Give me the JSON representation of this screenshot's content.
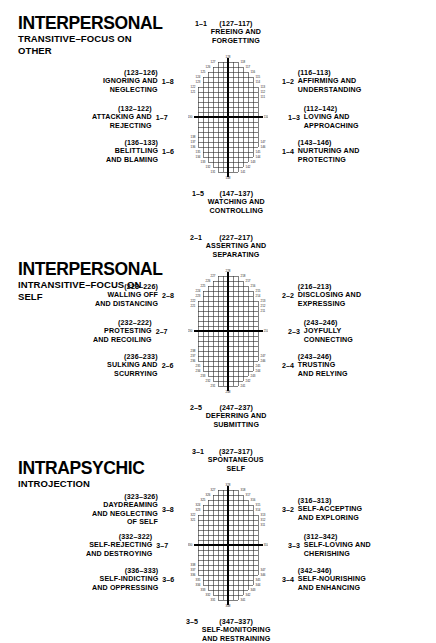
{
  "figure": {
    "line_color": "#000000",
    "background": "#ffffff"
  },
  "panels": [
    {
      "id": "interpersonal-transitive",
      "heading_main": "INTERPERSONAL",
      "heading_sub_line1": "TRANSITIVE–FOCUS ON",
      "heading_sub_line2": "OTHER",
      "poles": [
        {
          "qnum": "1–1",
          "code": "(127–117)",
          "lines": [
            "FREEING AND",
            "FORGETTING"
          ],
          "pos": "top"
        },
        {
          "qnum": "1–2",
          "code": "(116–113)",
          "lines": [
            "AFFIRMING AND",
            "UNDERSTANDING"
          ],
          "pos": "top-right"
        },
        {
          "qnum": "1–3",
          "code": "(112–142)",
          "lines": [
            "LOVING AND",
            "APPROACHING"
          ],
          "pos": "right"
        },
        {
          "qnum": "1–4",
          "code": "(143–146)",
          "lines": [
            "NURTURING AND",
            "PROTECTING"
          ],
          "pos": "bottom-right"
        },
        {
          "qnum": "1–5",
          "code": "(147–137)",
          "lines": [
            "WATCHING AND",
            "CONTROLLING"
          ],
          "pos": "bottom"
        },
        {
          "qnum": "1–6",
          "code": "(136–133)",
          "lines": [
            "BELITTLING",
            "AND BLAMING"
          ],
          "pos": "bottom-left"
        },
        {
          "qnum": "1–7",
          "code": "(132–122)",
          "lines": [
            "ATTACKING AND",
            "REJECTING"
          ],
          "pos": "left"
        },
        {
          "qnum": "1–8",
          "code": "(123–126)",
          "lines": [
            "IGNORING AND",
            "NEGLECTING"
          ],
          "pos": "top-left"
        }
      ],
      "axis_labels": {
        "top": "128",
        "bottom": "148",
        "left": "130",
        "right": "110",
        "upper_left": [
          "127",
          "126",
          "125",
          "124",
          "123",
          "122",
          "121"
        ],
        "upper_right": [
          "118",
          "117",
          "116",
          "115",
          "114",
          "113",
          "112",
          "111"
        ],
        "lower_left": [
          "131",
          "132",
          "133",
          "134",
          "135",
          "136",
          "137",
          "138"
        ],
        "lower_right": [
          "141",
          "142",
          "143",
          "144",
          "145",
          "146",
          "147"
        ]
      }
    },
    {
      "id": "interpersonal-intransitive",
      "heading_main": "INTERPERSONAL",
      "heading_sub_line1": "INTRANSITIVE–FOCUS ON",
      "heading_sub_line2": "SELF",
      "poles": [
        {
          "qnum": "2–1",
          "code": "(227–217)",
          "lines": [
            "ASSERTING AND",
            "SEPARATING"
          ],
          "pos": "top"
        },
        {
          "qnum": "2–2",
          "code": "(216–213)",
          "lines": [
            "DISCLOSING AND",
            "EXPRESSING"
          ],
          "pos": "top-right"
        },
        {
          "qnum": "2–3",
          "code": "(243–246)",
          "lines": [
            "JOYFULLY",
            "CONNECTING"
          ],
          "pos": "right"
        },
        {
          "qnum": "2–4",
          "code": "(243–246)",
          "lines": [
            "TRUSTING",
            "AND RELYING"
          ],
          "pos": "bottom-right"
        },
        {
          "qnum": "2–5",
          "code": "(247–237)",
          "lines": [
            "DEFERRING AND",
            "SUBMITTING"
          ],
          "pos": "bottom"
        },
        {
          "qnum": "2–6",
          "code": "(236–233)",
          "lines": [
            "SULKING AND",
            "SCURRYING"
          ],
          "pos": "bottom-left"
        },
        {
          "qnum": "2–7",
          "code": "(232–222)",
          "lines": [
            "PROTESTING",
            "AND RECOILING"
          ],
          "pos": "left"
        },
        {
          "qnum": "2–8",
          "code": "(223–226)",
          "lines": [
            "WALLING OFF",
            "AND DISTANCING"
          ],
          "pos": "top-left"
        }
      ],
      "axis_labels": {
        "top": "228",
        "bottom": "248",
        "left": "230",
        "right": "210",
        "upper_left": [
          "227",
          "226",
          "225",
          "224",
          "223",
          "222",
          "221"
        ],
        "upper_right": [
          "218",
          "217",
          "216",
          "215",
          "214",
          "213",
          "212",
          "211"
        ],
        "lower_left": [
          "231",
          "232",
          "233",
          "234",
          "235",
          "236",
          "237",
          "238"
        ],
        "lower_right": [
          "241",
          "242",
          "243",
          "244",
          "245",
          "246",
          "247"
        ]
      }
    },
    {
      "id": "intrapsychic",
      "heading_main": "INTRAPSYCHIC",
      "heading_sub_line1": "INTROJECTION",
      "heading_sub_line2": "",
      "poles": [
        {
          "qnum": "3–1",
          "code": "(327–317)",
          "lines": [
            "SPONTANEOUS",
            "SELF"
          ],
          "pos": "top"
        },
        {
          "qnum": "3–2",
          "code": "(316–313)",
          "lines": [
            "SELF-ACCEPTING",
            "AND EXPLORING"
          ],
          "pos": "top-right"
        },
        {
          "qnum": "3–3",
          "code": "(312–342)",
          "lines": [
            "SELF-LOVING AND",
            "CHERISHING"
          ],
          "pos": "right"
        },
        {
          "qnum": "3–4",
          "code": "(342–346)",
          "lines": [
            "SELF-NOURISHING",
            "AND ENHANCING"
          ],
          "pos": "bottom-right"
        },
        {
          "qnum": "3–5",
          "code": "(347–337)",
          "lines": [
            "SELF-MONITORING",
            "AND RESTRAINING"
          ],
          "pos": "bottom"
        },
        {
          "qnum": "3–6",
          "code": "(336–333)",
          "lines": [
            "SELF-INDICTING",
            "AND OPPRESSING"
          ],
          "pos": "bottom-left"
        },
        {
          "qnum": "3–7",
          "code": "(332–322)",
          "lines": [
            "SELF-REJECTING",
            "AND DESTROYING"
          ],
          "pos": "left"
        },
        {
          "qnum": "3–8",
          "code": "(323–326)",
          "lines": [
            "DAYDREAMING",
            "AND NEGLECTING",
            "OF SELF"
          ],
          "pos": "top-left"
        }
      ],
      "axis_labels": {
        "top": "328",
        "bottom": "348",
        "left": "330",
        "right": "310",
        "upper_left": [
          "327",
          "326",
          "325",
          "324",
          "323",
          "322",
          "321"
        ],
        "upper_right": [
          "318",
          "317",
          "316",
          "315",
          "314",
          "313",
          "312",
          "311"
        ],
        "lower_left": [
          "331",
          "332",
          "333",
          "334",
          "335",
          "336",
          "337",
          "338"
        ],
        "lower_right": [
          "341",
          "342",
          "343",
          "344",
          "345",
          "346",
          "347"
        ]
      }
    }
  ]
}
